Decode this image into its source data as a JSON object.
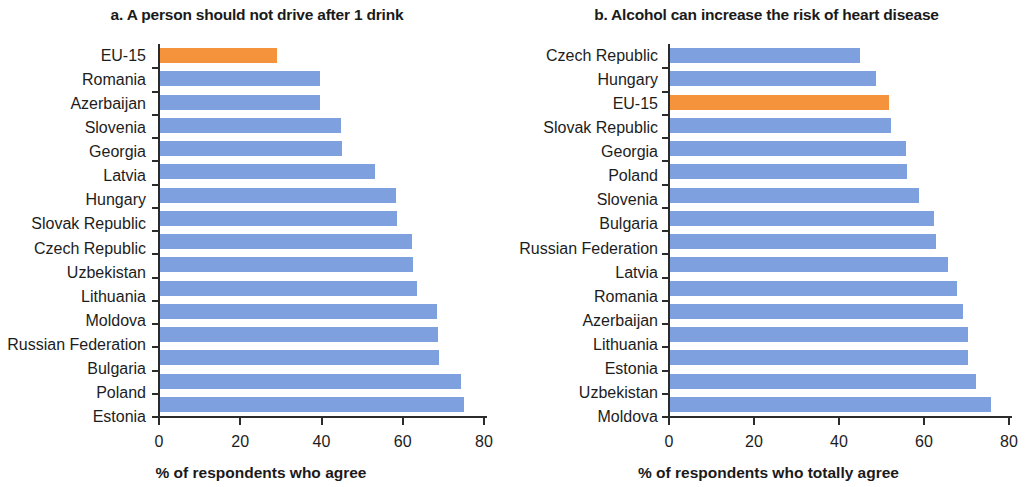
{
  "chart_data": [
    {
      "type": "bar",
      "panel": "a",
      "title": "a. A person should not drive after 1 drink",
      "xlabel": "% of respondents who agree",
      "ylabel": "",
      "orientation": "horizontal",
      "xlim": [
        0,
        80
      ],
      "xticks": [
        0,
        20,
        40,
        60,
        80
      ],
      "xticklabels": [
        "0",
        "20",
        "40",
        "60",
        "80"
      ],
      "grid": false,
      "legend": "none",
      "highlight_category": "EU-15",
      "colors": {
        "bar": "#7FA0DF",
        "highlight": "#F4933C"
      },
      "categories": [
        "EU-15",
        "Romania",
        "Azerbaijan",
        "Slovenia",
        "Georgia",
        "Latvia",
        "Hungary",
        "Slovak Republic",
        "Czech Republic",
        "Uzbekistan",
        "Lithuania",
        "Moldova",
        "Russian Federation",
        "Bulgaria",
        "Poland",
        "Estonia"
      ],
      "values": [
        28.8,
        39.4,
        39.3,
        44.6,
        44.8,
        53.0,
        58.0,
        58.4,
        62.0,
        62.3,
        63.2,
        68.2,
        68.5,
        68.7,
        74.0,
        74.8
      ]
    },
    {
      "type": "bar",
      "panel": "b",
      "title": "b. Alcohol can increase the risk of heart disease",
      "xlabel": "% of respondents who totally agree",
      "ylabel": "",
      "orientation": "horizontal",
      "xlim": [
        0,
        80
      ],
      "xticks": [
        0,
        20,
        40,
        60,
        80
      ],
      "xticklabels": [
        "0",
        "20",
        "40",
        "60",
        "80"
      ],
      "grid": false,
      "legend": "none",
      "highlight_category": "EU-15",
      "colors": {
        "bar": "#7FA0DF",
        "highlight": "#F4933C"
      },
      "categories": [
        "Czech Republic",
        "Hungary",
        "EU-15",
        "Slovak Republic",
        "Georgia",
        "Poland",
        "Slovenia",
        "Bulgaria",
        "Russian Federation",
        "Latvia",
        "Romania",
        "Azerbaijan",
        "Lithuania",
        "Estonia",
        "Uzbekistan",
        "Moldova"
      ],
      "values": [
        44.7,
        48.5,
        51.5,
        52.0,
        55.5,
        55.7,
        58.5,
        62.0,
        62.5,
        65.5,
        67.5,
        69.0,
        70.0,
        70.2,
        72.0,
        75.5
      ]
    }
  ]
}
